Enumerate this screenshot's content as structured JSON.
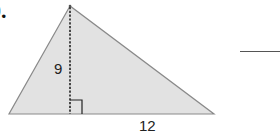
{
  "problem": {
    "number_label": "0."
  },
  "figure": {
    "shape": "triangle",
    "fill_color": "#e2e2e2",
    "stroke_color": "#8a8a8a",
    "height_label": "9",
    "base_label": "12",
    "height_line_style": "dashed",
    "right_angle_marker": true
  },
  "answer": {
    "value": ""
  }
}
